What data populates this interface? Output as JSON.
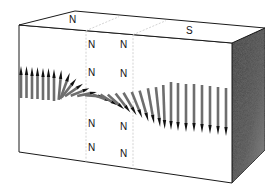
{
  "diagram": {
    "box": {
      "top_face": [
        [
          75,
          11
        ],
        [
          19,
          25
        ],
        [
          232,
          43
        ],
        [
          265,
          28
        ]
      ],
      "front_face": [
        [
          19,
          25
        ],
        [
          232,
          43
        ],
        [
          232,
          183
        ],
        [
          19,
          152
        ]
      ],
      "right_face": [
        [
          232,
          43
        ],
        [
          265,
          28
        ],
        [
          265,
          150
        ],
        [
          232,
          183
        ]
      ],
      "edge_color": "#1a1a1a",
      "right_face_color": "#4a4a4a"
    },
    "wall_region": {
      "front_dashed_x": [
        86,
        133
      ],
      "dash_color": "#c8c8c8"
    },
    "labels": {
      "top_left": {
        "text": "N",
        "x": 69,
        "y": 23
      },
      "top_right": {
        "text": "S",
        "x": 186,
        "y": 34
      },
      "wall_face": [
        {
          "text": "N",
          "x": 88,
          "y": 48
        },
        {
          "text": "N",
          "x": 120,
          "y": 48
        },
        {
          "text": "N",
          "x": 88,
          "y": 76
        },
        {
          "text": "N",
          "x": 120,
          "y": 77
        },
        {
          "text": "N",
          "x": 88,
          "y": 127
        },
        {
          "text": "N",
          "x": 120,
          "y": 130
        },
        {
          "text": "N",
          "x": 88,
          "y": 151
        },
        {
          "text": "N",
          "x": 120,
          "y": 157
        }
      ]
    },
    "arrows": {
      "color": "#6e6e6e",
      "head_color": "#111111",
      "items": [
        {
          "x": 21,
          "cy": 82,
          "len": 32,
          "angle": 0
        },
        {
          "x": 26.5,
          "cy": 82,
          "len": 32,
          "angle": 0
        },
        {
          "x": 32,
          "cy": 83,
          "len": 32,
          "angle": 0
        },
        {
          "x": 37.5,
          "cy": 83,
          "len": 32,
          "angle": 0
        },
        {
          "x": 43,
          "cy": 84,
          "len": 32,
          "angle": 0
        },
        {
          "x": 48.5,
          "cy": 84,
          "len": 32,
          "angle": 0
        },
        {
          "x": 54,
          "cy": 85,
          "len": 32,
          "angle": 0
        },
        {
          "x": 60,
          "cy": 85,
          "len": 30,
          "angle": 5
        },
        {
          "x": 65,
          "cy": 86,
          "len": 28,
          "angle": 20
        },
        {
          "x": 69,
          "cy": 88,
          "len": 24,
          "angle": 38
        },
        {
          "x": 74,
          "cy": 90,
          "len": 22,
          "angle": 55
        },
        {
          "x": 80,
          "cy": 92,
          "len": 20,
          "angle": 68
        },
        {
          "x": 87,
          "cy": 94,
          "len": 20,
          "angle": 78
        },
        {
          "x": 95,
          "cy": 96,
          "len": 20,
          "angle": 95
        },
        {
          "x": 102,
          "cy": 98,
          "len": 20,
          "angle": 110
        },
        {
          "x": 109,
          "cy": 100,
          "len": 20,
          "angle": 122
        },
        {
          "x": 116,
          "cy": 102,
          "len": 22,
          "angle": 132
        },
        {
          "x": 123,
          "cy": 103,
          "len": 24,
          "angle": 142
        },
        {
          "x": 130,
          "cy": 104,
          "len": 26,
          "angle": 150
        },
        {
          "x": 137,
          "cy": 105,
          "len": 28,
          "angle": 158
        },
        {
          "x": 144,
          "cy": 106,
          "len": 32,
          "angle": 164
        },
        {
          "x": 151,
          "cy": 106,
          "len": 36,
          "angle": 170
        },
        {
          "x": 158,
          "cy": 107,
          "len": 40,
          "angle": 174
        },
        {
          "x": 164,
          "cy": 107,
          "len": 44,
          "angle": 178
        },
        {
          "x": 171,
          "cy": 106,
          "len": 48,
          "angle": 180
        },
        {
          "x": 178,
          "cy": 107,
          "len": 48,
          "angle": 180
        },
        {
          "x": 186,
          "cy": 108,
          "len": 48,
          "angle": 180
        },
        {
          "x": 194,
          "cy": 108,
          "len": 48,
          "angle": 180
        },
        {
          "x": 202,
          "cy": 109,
          "len": 48,
          "angle": 180
        },
        {
          "x": 210,
          "cy": 110,
          "len": 48,
          "angle": 180
        },
        {
          "x": 218,
          "cy": 111,
          "len": 48,
          "angle": 180
        },
        {
          "x": 226,
          "cy": 112,
          "len": 48,
          "angle": 180
        }
      ]
    }
  }
}
